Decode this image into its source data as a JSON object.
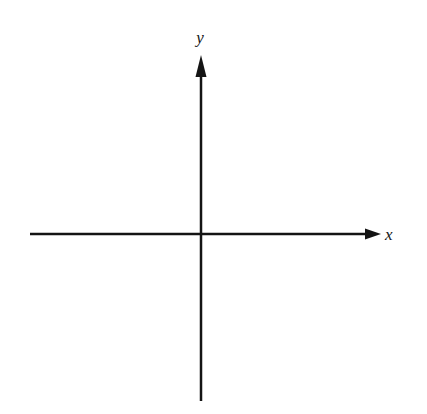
{
  "figure": {
    "kind": "cartesian-axes-diagram",
    "background_color": "#ffffff",
    "stroke_color": "#141414",
    "width": 427,
    "height": 414
  },
  "chart_data": {
    "type": "scatter",
    "title": "",
    "subtitle": "",
    "xlabel": "x",
    "ylabel": "y",
    "series": [],
    "x": [],
    "values": [],
    "categories": [],
    "annotations": [],
    "legend": {
      "entries": [],
      "position": "none"
    },
    "grid": false,
    "ticks": {
      "x": [],
      "y": []
    },
    "xlim": [
      -1,
      1
    ],
    "ylim": [
      -1,
      1
    ],
    "origin_marked": false
  },
  "axes": {
    "x_axis": {
      "name": "x",
      "label": "x",
      "orientation": "horizontal",
      "start_x": 30,
      "end_x": 381,
      "y": 234,
      "arrow_end": "positive",
      "arrow_length": 16,
      "arrow_half_width": 5.5,
      "stroke_width": 2.5,
      "label_x": 390,
      "label_y": 237
    },
    "y_axis": {
      "name": "y",
      "label": "y",
      "orientation": "vertical",
      "start_y": 401,
      "end_y": 55,
      "x": 201,
      "arrow_end": "positive",
      "arrow_length": 22,
      "arrow_half_width": 5.5,
      "stroke_width": 2.5,
      "label_x": 200,
      "label_y": 40
    },
    "origin": {
      "label": "",
      "x": 201,
      "y": 234
    }
  }
}
